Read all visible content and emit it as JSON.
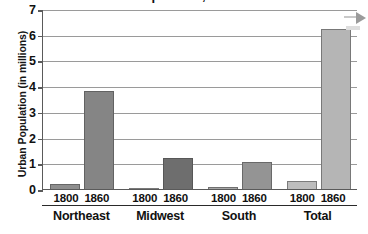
{
  "figure": {
    "title_sliver": "Urban Population, 1800–1860",
    "corner_arrow_icon": "arrow-right-icon"
  },
  "chart_data": {
    "type": "bar",
    "title": "",
    "xlabel": "",
    "ylabel": "Urban Population (in millions)",
    "ylim": [
      0,
      7
    ],
    "yticks": [
      "0",
      "1",
      "2",
      "3",
      "4",
      "5",
      "6",
      "7"
    ],
    "grid": true,
    "legend": "none",
    "categories": [
      "Northeast",
      "Midwest",
      "South",
      "Total"
    ],
    "series": [
      {
        "name": "1800",
        "values": [
          0.21,
          0.01,
          0.08,
          0.32
        ],
        "color": "#8f8f8f"
      },
      {
        "name": "1860",
        "values": [
          3.8,
          1.22,
          1.05,
          6.22
        ],
        "color": "#7c7c7c"
      }
    ],
    "bars": [
      {
        "group": "Northeast",
        "year": "1800",
        "value": 0.21,
        "color": "#8e8e8e"
      },
      {
        "group": "Northeast",
        "year": "1860",
        "value": 3.8,
        "color": "#858585"
      },
      {
        "group": "Midwest",
        "year": "1800",
        "value": 0.01,
        "color": "#b8b8b8"
      },
      {
        "group": "Midwest",
        "year": "1860",
        "value": 1.22,
        "color": "#6e6e6e"
      },
      {
        "group": "South",
        "year": "1800",
        "value": 0.08,
        "color": "#a5a5a5"
      },
      {
        "group": "South",
        "year": "1860",
        "value": 1.05,
        "color": "#949494"
      },
      {
        "group": "Total",
        "year": "1800",
        "value": 0.32,
        "color": "#bdbdbd"
      },
      {
        "group": "Total",
        "year": "1860",
        "value": 6.22,
        "color": "#b5b5b5"
      }
    ]
  },
  "axis": {
    "y_ticks": [
      {
        "label": "7",
        "value": 7
      },
      {
        "label": "6",
        "value": 6
      },
      {
        "label": "5",
        "value": 5
      },
      {
        "label": "4",
        "value": 4
      },
      {
        "label": "3",
        "value": 3
      },
      {
        "label": "2",
        "value": 2
      },
      {
        "label": "1",
        "value": 1
      },
      {
        "label": "0",
        "value": 0
      }
    ],
    "groups": [
      {
        "region": "Northeast",
        "years": [
          "1800",
          "1860"
        ]
      },
      {
        "region": "Midwest",
        "years": [
          "1800",
          "1860"
        ]
      },
      {
        "region": "South",
        "years": [
          "1800",
          "1860"
        ]
      },
      {
        "region": "Total",
        "years": [
          "1800",
          "1860"
        ]
      }
    ]
  },
  "colors": {
    "gridline": "#9a9a9a",
    "axis": "#5a5a5a",
    "text": "#111111",
    "background": "#ffffff"
  }
}
